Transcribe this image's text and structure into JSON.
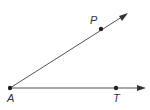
{
  "diagram": {
    "type": "angle",
    "vertex": {
      "label": "A",
      "x": 10,
      "y": 88
    },
    "rays": [
      {
        "name": "ray-AP",
        "through": {
          "label": "P",
          "x": 101,
          "y": 29
        },
        "end": {
          "x": 127,
          "y": 14
        }
      },
      {
        "name": "ray-AT",
        "through": {
          "label": "T",
          "x": 116,
          "y": 88
        },
        "end": {
          "x": 145,
          "y": 88
        }
      }
    ],
    "colors": {
      "line": "#555555",
      "point": "#222222",
      "label": "#333333"
    }
  }
}
